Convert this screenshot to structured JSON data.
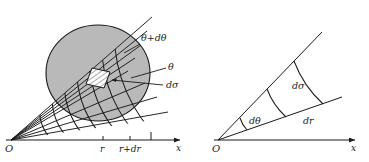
{
  "figure": {
    "background_color": "#ffffff",
    "line_color": "#1a1a1a",
    "shade_color": "#b9b9b9",
    "hatch_color": "#ffffff"
  },
  "left_panel": {
    "name": "polar-grid-with-shaded-disc",
    "origin_label": "O",
    "axis_label_x": "x",
    "tick_labels": [
      "r",
      "r+dr"
    ],
    "annotations": [
      {
        "id": "theta-plus-dtheta",
        "text": "θ+dθ"
      },
      {
        "id": "theta",
        "text": "θ"
      },
      {
        "id": "dsigma",
        "text": "dσ"
      }
    ],
    "radial_line_count": 9,
    "arc_count": 7,
    "shaded_region": "disc",
    "highlighted_cell": "hatched area element dσ"
  },
  "right_panel": {
    "name": "single-wedge-element",
    "origin_label": "O",
    "axis_label_x": "x",
    "annotations": [
      {
        "id": "dtheta",
        "text": "dθ"
      },
      {
        "id": "dsigma",
        "text": "dσ"
      },
      {
        "id": "dr",
        "text": "dr"
      }
    ],
    "arc_count": 3,
    "ray_count": 2
  }
}
